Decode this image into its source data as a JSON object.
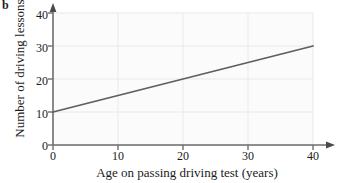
{
  "panel": {
    "label": "b"
  },
  "chart_data": {
    "type": "line",
    "title": "",
    "subtitle": "",
    "xlabel": "Age on passing driving test (years)",
    "ylabel": "Number of driving lessons",
    "xlim": [
      0,
      40
    ],
    "ylim": [
      0,
      40
    ],
    "xticks": [
      0,
      10,
      20,
      30,
      40
    ],
    "yticks": [
      0,
      10,
      20,
      30,
      40
    ],
    "xtick_labels": [
      "0",
      "10",
      "20",
      "30",
      "40"
    ],
    "ytick_labels": [
      "0",
      "10",
      "20",
      "30",
      "40"
    ],
    "grid": true,
    "grid_color": "#e9e9e9",
    "legend": "none",
    "axis_arrows": [
      "x-right",
      "y-up"
    ],
    "series": [
      {
        "name": "line of best fit",
        "color": "#5e5e5e",
        "intercept": 10,
        "slope": 0.5,
        "x": [
          0,
          10,
          20,
          30,
          40
        ],
        "values": [
          10,
          15,
          20,
          25,
          30
        ],
        "endpoints": [
          [
            0,
            10
          ],
          [
            40,
            30
          ]
        ]
      }
    ],
    "annotations": []
  },
  "colors": {
    "line": "#5e5e5e",
    "axis": "#6d6d6d",
    "grid": "#e9e9e9",
    "plot_background": "#fbfbfb",
    "text": "#1b1b1b"
  }
}
